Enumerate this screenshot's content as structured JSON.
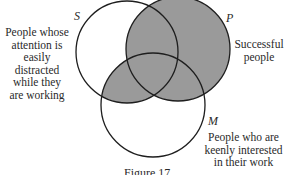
{
  "diagram": {
    "type": "venn-3",
    "colors": {
      "shade": "#9a9a9a",
      "stroke": "#1e1e1e",
      "background": "#ffffff"
    },
    "sets": [
      {
        "id": "S",
        "letter": "S",
        "description": [
          "People whose",
          "attention is",
          "easily distracted",
          "while they",
          "are working"
        ]
      },
      {
        "id": "P",
        "letter": "P",
        "description": [
          "Successful",
          "people"
        ]
      },
      {
        "id": "M",
        "letter": "M",
        "description": [
          "People who are",
          "keenly interested",
          "in their work"
        ]
      }
    ],
    "shaded_regions": [
      "P only",
      "S∩P",
      "P∩M",
      "S∩P∩M",
      "S∩M"
    ],
    "caption": "Figure 17"
  }
}
